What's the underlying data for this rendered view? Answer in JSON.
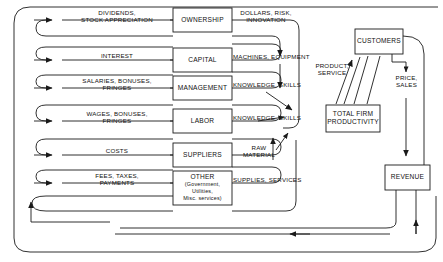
{
  "figure": {
    "type": "flow-diagram",
    "background_color": "#ffffff",
    "line_color": "#1a1a1a",
    "text_color": "#111111"
  },
  "stakeholder_boxes": [
    {
      "id": "ownership",
      "label": "OWNERSHIP"
    },
    {
      "id": "capital",
      "label": "CAPITAL"
    },
    {
      "id": "management",
      "label": "MANAGEMENT"
    },
    {
      "id": "labor",
      "label": "LABOR"
    },
    {
      "id": "suppliers",
      "label": "SUPPLIERS"
    },
    {
      "id": "other",
      "label": "OTHER",
      "sub_lines": [
        "(Government,",
        "Utilities,",
        "Misc. services)"
      ]
    }
  ],
  "outflow_labels": [
    {
      "id": "dividends",
      "line1": "DIVIDENDS,",
      "line2": "STOCK APPRECIATION"
    },
    {
      "id": "interest",
      "line1": "INTEREST",
      "line2": ""
    },
    {
      "id": "salaries",
      "line1": "SALARIES, BONUSES,",
      "line2": "FRINGES"
    },
    {
      "id": "wages",
      "line1": "WAGES, BONUSES,",
      "line2": "FRINGES"
    },
    {
      "id": "costs",
      "line1": "COSTS",
      "line2": ""
    },
    {
      "id": "fees",
      "line1": "FEES, TAXES,",
      "line2": "PAYMENTS"
    }
  ],
  "inflow_labels": [
    {
      "id": "dollars-risk-innovation",
      "line1": "DOLLARS, RISK,",
      "line2": "INNOVATION"
    },
    {
      "id": "machines-equipment",
      "line1": "MACHINES, EQUIPMENT",
      "line2": ""
    },
    {
      "id": "knowledge-skills-mgmt",
      "line1": "KNOWLEDGE, SKILLS",
      "line2": ""
    },
    {
      "id": "knowledge-skills-labor",
      "line1": "KNOWLEDGE, SKILLS",
      "line2": ""
    },
    {
      "id": "raw-material",
      "line1": "RAW",
      "line2": "MATERIAL"
    },
    {
      "id": "supplies-services",
      "line1": "SUPPLIES, SERVICES",
      "line2": ""
    }
  ],
  "process_boxes": [
    {
      "id": "customers",
      "label": "CUSTOMERS"
    },
    {
      "id": "total-firm-productivity",
      "line1": "TOTAL FIRM",
      "line2": "PRODUCTIVITY"
    },
    {
      "id": "revenue",
      "label": "REVENUE"
    }
  ],
  "market_labels": [
    {
      "id": "product-service",
      "line1": "PRODUCT,",
      "line2": "SERVICE"
    },
    {
      "id": "price-sales",
      "line1": "PRICE,",
      "line2": "SALES"
    }
  ]
}
